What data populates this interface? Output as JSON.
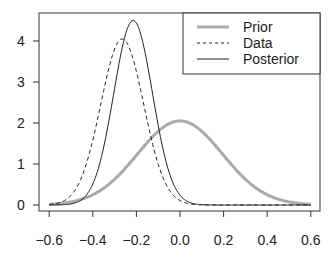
{
  "chart_data": {
    "type": "line",
    "title": "",
    "xlabel": "",
    "ylabel": "",
    "xlim": [
      -0.6,
      0.6
    ],
    "ylim": [
      0,
      4.6
    ],
    "x_ticks": [
      "-0.6",
      "-0.4",
      "-0.2",
      "0.0",
      "0.2",
      "0.4",
      "0.6"
    ],
    "x_tick_values": [
      -0.6,
      -0.4,
      -0.2,
      0.0,
      0.2,
      0.4,
      0.6
    ],
    "y_ticks": [
      "0",
      "1",
      "2",
      "3",
      "4"
    ],
    "y_tick_values": [
      0,
      1,
      2,
      3,
      4
    ],
    "grid": false,
    "legend_position": "top-right",
    "series": [
      {
        "name": "Prior",
        "distribution": "normal",
        "mean": 0.0,
        "sd": 0.195,
        "peak": 2.05,
        "color": "#aaaaaa",
        "style": "solid",
        "width": 3
      },
      {
        "name": "Data",
        "distribution": "normal",
        "mean": -0.265,
        "sd": 0.0985,
        "peak": 4.05,
        "color": "#222222",
        "style": "dashed",
        "width": 1
      },
      {
        "name": "Posterior",
        "distribution": "normal",
        "mean": -0.215,
        "sd": 0.0887,
        "peak": 4.5,
        "color": "#222222",
        "style": "solid",
        "width": 1
      }
    ]
  }
}
